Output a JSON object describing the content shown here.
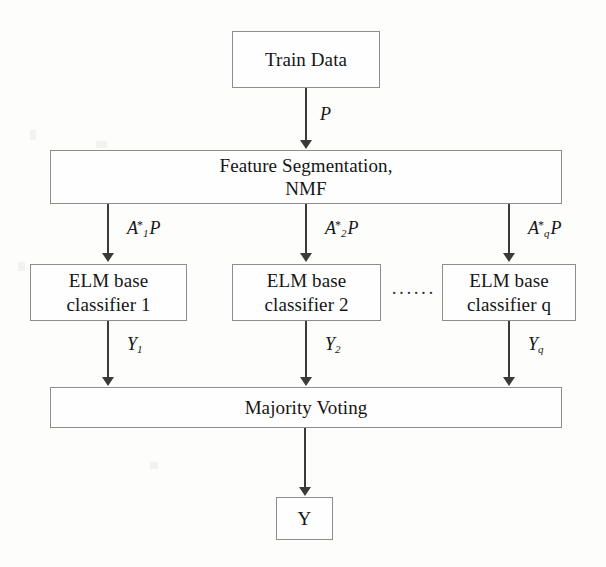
{
  "diagram": {
    "nodes": {
      "train_data": "Train Data",
      "feature_segmentation_line1": "Feature Segmentation,",
      "feature_segmentation_line2": "NMF",
      "elm_1_line1": "ELM base",
      "elm_1_line2": "classifier 1",
      "elm_2_line1": "ELM base",
      "elm_2_line2": "classifier 2",
      "elm_q_line1": "ELM base",
      "elm_q_line2": "classifier q",
      "majority_voting": "Majority Voting",
      "output": "Y"
    },
    "ellipsis": "······",
    "edges": [
      {
        "name": "train-to-nmf",
        "base": "P",
        "sub": "",
        "sup": "",
        "post": ""
      },
      {
        "name": "nmf-to-elm-1",
        "base": "A",
        "sub": "1",
        "sup": "*",
        "post": "P"
      },
      {
        "name": "nmf-to-elm-2",
        "base": "A",
        "sub": "2",
        "sup": "*",
        "post": "P"
      },
      {
        "name": "nmf-to-elm-q",
        "base": "A",
        "sub": "q",
        "sup": "*",
        "post": "P"
      },
      {
        "name": "elm-1-to-vote",
        "base": "Y",
        "sub": "1",
        "sup": "",
        "post": ""
      },
      {
        "name": "elm-2-to-vote",
        "base": "Y",
        "sub": "2",
        "sup": "",
        "post": ""
      },
      {
        "name": "elm-q-to-vote",
        "base": "Y",
        "sub": "q",
        "sup": "",
        "post": ""
      }
    ],
    "colors": {
      "box_border": "#8d8d8d",
      "arrow": "#3a3a3a",
      "text": "#151515",
      "background": "#fdfdfc"
    }
  }
}
